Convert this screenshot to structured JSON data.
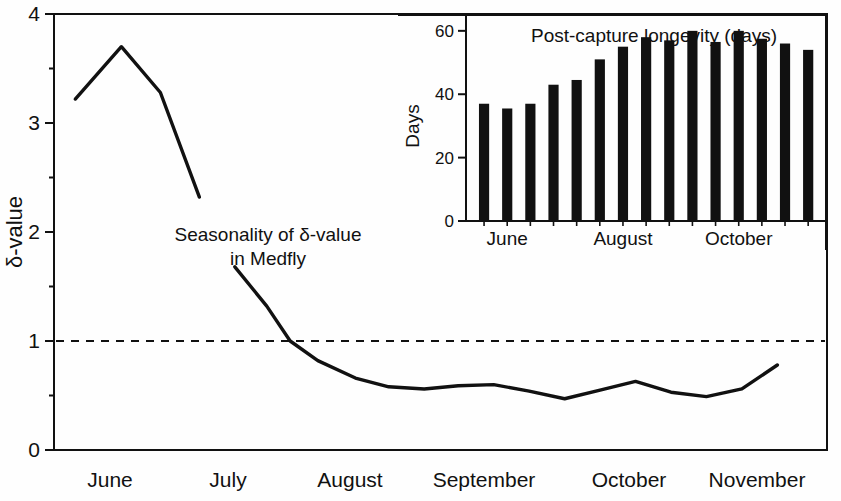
{
  "chart_data": [
    {
      "id": "main",
      "type": "line",
      "title": "",
      "annotation": "Seasonality of δ-value in Medfly",
      "annotation_lines": [
        "Seasonality of δ-value",
        "in Medfly"
      ],
      "xlabel": "",
      "ylabel": "δ-value",
      "ylim": [
        0,
        4
      ],
      "yticks": [
        0,
        1,
        2,
        3,
        4
      ],
      "ytick_labels": [
        "0",
        "1",
        "2",
        "3",
        "4"
      ],
      "yminor_ticks": [
        0.5,
        1.5,
        2.5,
        3.5
      ],
      "xtick_labels": [
        "June",
        "July",
        "August",
        "September",
        "October",
        "November"
      ],
      "grid": false,
      "legend": "none",
      "reference_line": {
        "y": 1,
        "style": "dashed",
        "label": ""
      },
      "series": [
        {
          "name": "δ-value early season",
          "x": [
            0.3,
            0.95,
            1.5,
            2.05
          ],
          "values": [
            3.22,
            3.7,
            3.28,
            2.32
          ]
        },
        {
          "name": "δ-value late season",
          "x": [
            2.55,
            3.0,
            3.33,
            3.72,
            4.25,
            4.72,
            5.22,
            5.7,
            6.2,
            6.7,
            7.2,
            7.7,
            8.2,
            8.7,
            9.2,
            9.7,
            10.2
          ],
          "values": [
            1.68,
            1.32,
            1.0,
            0.82,
            0.66,
            0.58,
            0.56,
            0.59,
            0.6,
            0.54,
            0.47,
            0.55,
            0.63,
            0.53,
            0.49,
            0.56,
            0.78
          ]
        }
      ]
    },
    {
      "id": "inset",
      "type": "bar",
      "title": "Post-capture longevity (days)",
      "xlabel": "",
      "ylabel": "Days",
      "ylim": [
        0,
        65
      ],
      "yticks": [
        0,
        20,
        40,
        60
      ],
      "ytick_labels": [
        "0",
        "20",
        "40",
        "60"
      ],
      "xtick_labels": [
        "June",
        "August",
        "October"
      ],
      "grid": false,
      "legend": "none",
      "categories": [
        "1",
        "2",
        "3",
        "4",
        "5",
        "6",
        "7",
        "8",
        "9",
        "10",
        "11",
        "12",
        "13",
        "14",
        "15"
      ],
      "values": [
        37,
        35.5,
        37,
        43,
        44.5,
        51,
        55,
        58,
        57,
        60,
        56.5,
        60,
        57.5,
        56,
        54
      ],
      "bar_color": "#111111"
    }
  ],
  "figure": {
    "background": "#ffffff",
    "line_color": "#111111",
    "axis_color": "#111111"
  }
}
